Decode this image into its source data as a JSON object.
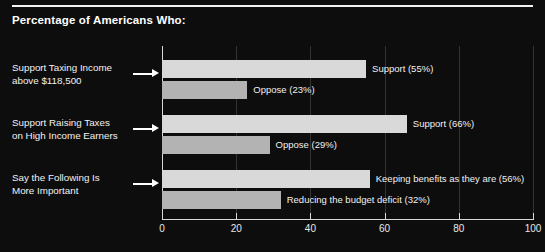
{
  "header": {
    "title": "Percentage of Americans Who:"
  },
  "chart_data": {
    "type": "bar",
    "orientation": "horizontal",
    "title": "Percentage of Americans Who:",
    "xlabel": "",
    "ylabel": "",
    "xlim": [
      0,
      100
    ],
    "xticks": [
      0,
      20,
      40,
      60,
      80,
      100
    ],
    "xticklabels": [
      "0",
      "20",
      "40",
      "60",
      "80",
      "100"
    ],
    "grid": true,
    "legend": "none",
    "groups": [
      {
        "label_line1": "Support Taxing Income",
        "label_line2": "above $118,500",
        "bars": [
          {
            "label": "Support (55%)",
            "value": 55,
            "series": "support",
            "color": "#d9d9d9"
          },
          {
            "label": "Oppose (23%)",
            "value": 23,
            "series": "oppose",
            "color": "#b3b3b3"
          }
        ]
      },
      {
        "label_line1": "Support Raising Taxes",
        "label_line2": "on High Income Earners",
        "bars": [
          {
            "label": "Support (66%)",
            "value": 66,
            "series": "support",
            "color": "#d9d9d9"
          },
          {
            "label": "Oppose (29%)",
            "value": 29,
            "series": "oppose",
            "color": "#b3b3b3"
          }
        ]
      },
      {
        "label_line1": "Say the Following Is",
        "label_line2": "More Important",
        "bars": [
          {
            "label": "Keeping benefits as they are (56%)",
            "value": 56,
            "series": "support",
            "color": "#d9d9d9"
          },
          {
            "label": "Reducing the budget deficit (32%)",
            "value": 32,
            "series": "oppose",
            "color": "#b3b3b3"
          }
        ]
      }
    ]
  },
  "colors": {
    "background": "#0d0d0d",
    "support_bar": "#d9d9d9",
    "oppose_bar": "#b3b3b3",
    "axis": "#d8d8d8",
    "text": "#ffffff"
  }
}
